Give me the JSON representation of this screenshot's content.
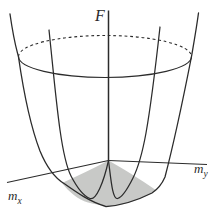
{
  "figure": {
    "labels": {
      "vertical_axis": "F",
      "x_axis_base": "m",
      "x_axis_sub": "x",
      "y_axis_base": "m",
      "y_axis_sub": "y"
    },
    "colors": {
      "line": "#2b2b2b",
      "shade": "#c8c9c7",
      "background": "#ffffff"
    }
  }
}
